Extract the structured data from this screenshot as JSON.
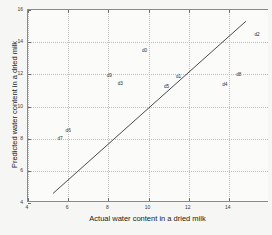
{
  "chart_data": {
    "type": "scatter",
    "title": "",
    "xlabel": "Actual water content in a dried milk",
    "ylabel": "Predicted water content in a dried milk",
    "xlim": [
      4,
      16
    ],
    "ylim": [
      4,
      16
    ],
    "xticks": [
      4,
      6,
      8,
      10,
      12,
      14
    ],
    "xticklabels": [
      "4",
      "6",
      "8",
      "10",
      "12",
      "14"
    ],
    "yticks": [
      4,
      6,
      8,
      10,
      12,
      14,
      16
    ],
    "yticklabels": [
      "4",
      "6",
      "8",
      "10",
      "12",
      "14",
      "16"
    ],
    "grid": true,
    "legend": "none",
    "points": [
      {
        "label": "d7",
        "x": 5.6,
        "y": 8.05
      },
      {
        "label": "d6",
        "x": 6.0,
        "y": 8.55
      },
      {
        "label": "d9",
        "x": 8.05,
        "y": 11.95
      },
      {
        "label": "d3",
        "x": 8.6,
        "y": 11.45
      },
      {
        "label": "d0",
        "x": 9.8,
        "y": 13.5
      },
      {
        "label": "d5",
        "x": 10.9,
        "y": 11.25
      },
      {
        "label": "d1",
        "x": 11.5,
        "y": 11.9
      },
      {
        "label": "d4",
        "x": 13.8,
        "y": 11.4
      },
      {
        "label": "d8",
        "x": 14.5,
        "y": 12.0
      },
      {
        "label": "d2",
        "x": 15.4,
        "y": 14.5
      }
    ],
    "fit_line": {
      "name": "identity-fit-line",
      "x_start": 5.25,
      "y_start": 4.6,
      "x_end": 14.85,
      "y_end": 15.3,
      "color": "#4a4a4a"
    },
    "series_note": "Predicted vs actual water content with labelled samples and a fitted reference line"
  },
  "colors": {
    "axis": "#8a8a8a",
    "grid": "#bdbdbd",
    "text": "#1a1a1a",
    "line": "#4a4a4a",
    "background": "#f6f6f4",
    "plot_background": "#fbfbfa"
  }
}
